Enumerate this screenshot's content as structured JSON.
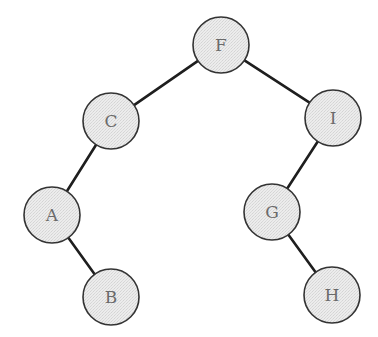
{
  "diagram": {
    "type": "binary-tree",
    "colors": {
      "node_fill": "#e6e6e6",
      "node_stroke": "#333333",
      "edge": "#1e1e1e",
      "label": "#6a6a6a",
      "background": "#ffffff"
    },
    "node_radius": 28,
    "nodes": [
      {
        "id": "F",
        "label": "F",
        "cx": 221,
        "cy": 45
      },
      {
        "id": "C",
        "label": "C",
        "cx": 111,
        "cy": 121
      },
      {
        "id": "I",
        "label": "I",
        "cx": 333,
        "cy": 118
      },
      {
        "id": "A",
        "label": "A",
        "cx": 52,
        "cy": 215
      },
      {
        "id": "G",
        "label": "G",
        "cx": 272,
        "cy": 212
      },
      {
        "id": "B",
        "label": "B",
        "cx": 111,
        "cy": 297
      },
      {
        "id": "H",
        "label": "H",
        "cx": 332,
        "cy": 295
      }
    ],
    "edges": [
      {
        "from": "F",
        "to": "C"
      },
      {
        "from": "F",
        "to": "I"
      },
      {
        "from": "C",
        "to": "A"
      },
      {
        "from": "A",
        "to": "B"
      },
      {
        "from": "I",
        "to": "G"
      },
      {
        "from": "G",
        "to": "H"
      }
    ]
  }
}
